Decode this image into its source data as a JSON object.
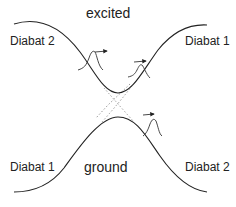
{
  "diagram": {
    "type": "potential-energy-surfaces",
    "states": {
      "excited": {
        "label": "excited"
      },
      "ground": {
        "label": "ground"
      }
    },
    "diabat_labels": {
      "upper_left": "Diabat 2",
      "upper_right": "Diabat 1",
      "lower_left": "Diabat 1",
      "lower_right": "Diabat 2"
    },
    "colors": {
      "curve": "#222222",
      "diabat_dotted": "#999999",
      "text": "#222222",
      "background": "#ffffff"
    },
    "wavepackets": [
      {
        "name": "excited-incoming",
        "direction": "right"
      },
      {
        "name": "excited-outgoing",
        "direction": "right"
      },
      {
        "name": "ground-outgoing",
        "direction": "right"
      }
    ]
  }
}
